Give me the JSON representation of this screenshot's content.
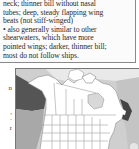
{
  "species_account": {
    "lines": [
      "neck; thinner bill without nasal",
      "tubes; deep, steady flapping wing",
      "beats (not stiff-winged)",
      "• also generally similar to other",
      "shearwaters, which have more",
      "pointed wings; darker, thinner bill;",
      "most do not follow ships."
    ]
  },
  "side_fragments": [
    "n",
    "",
    "",
    ",",
    "·",
    "r"
  ],
  "range_map": {
    "region": "North America",
    "colors": {
      "ocean": "#cfcfcf",
      "ocean_light": "#e6e6e6",
      "arctic": "#e9e9e9",
      "land": "#ffffff",
      "borders": "#8c8c8c",
      "range_dark": "#555555",
      "range_medium": "#a8a8a8",
      "lake": "#d8d8d8"
    }
  }
}
